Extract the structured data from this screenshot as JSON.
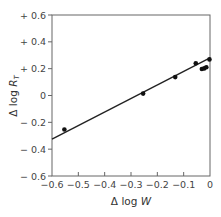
{
  "chart_data": {
    "type": "scatter",
    "title": "",
    "xlabel": "Δ log W",
    "xlabel_parts": {
      "prefix": "Δ log ",
      "var": "W"
    },
    "ylabel": "Δ log R_T",
    "ylabel_parts": {
      "prefix": "Δ log ",
      "var": "R",
      "sub": "T"
    },
    "xlim": [
      -0.6,
      0
    ],
    "ylim": [
      -0.6,
      0.6
    ],
    "x_ticks": [
      -0.6,
      -0.5,
      -0.4,
      -0.3,
      -0.2,
      -0.1,
      0
    ],
    "x_tick_labels": [
      "−0.6",
      "−0.5",
      "−0.4",
      "−0.3",
      "−0.2",
      "−0.1",
      "0"
    ],
    "y_ticks": [
      0.6,
      0.4,
      0.2,
      0,
      -0.2,
      -0.4,
      -0.6
    ],
    "y_tick_labels": [
      "+ 0.6",
      "+ 0.4",
      "+ 0.2",
      "0",
      "− 0.2",
      "− 0.4",
      "− 0.6"
    ],
    "grid": false,
    "legend": null,
    "series": [
      {
        "name": "observations",
        "marker": "filled-circle",
        "x": [
          -0.553,
          -0.254,
          -0.132,
          -0.054,
          -0.031,
          -0.022,
          -0.014,
          -0.002
        ],
        "y": [
          -0.253,
          0.014,
          0.137,
          0.24,
          0.197,
          0.202,
          0.21,
          0.269
        ]
      }
    ],
    "fit_line": {
      "name": "regression line",
      "x": [
        -0.6,
        0
      ],
      "y": [
        -0.325,
        0.28
      ]
    },
    "colors": {
      "line": "#222222",
      "points": "#111111",
      "frame": "#555555",
      "text": "#444444"
    }
  }
}
